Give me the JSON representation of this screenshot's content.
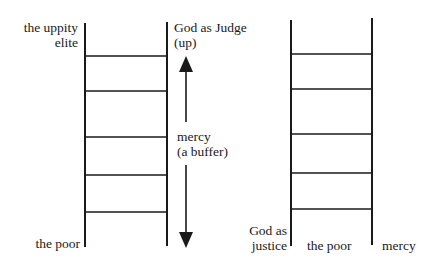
{
  "diagram": {
    "left_ladder": {
      "top_label_line1": "the uppity",
      "top_label_line2": "elite",
      "bottom_label": "the poor",
      "rungs": 5
    },
    "arrow": {
      "top_label_line1": "God as Judge",
      "top_label_line2": "(up)",
      "middle_label_line1": "mercy",
      "middle_label_line2": "(a buffer)",
      "direction": "bidirectional vertical"
    },
    "right_ladder": {
      "left_label_line1": "God as",
      "left_label_line2": "justice",
      "middle_label": "the poor",
      "right_label": "mercy",
      "rungs": 5
    },
    "colors": {
      "line": "#1a1a1a",
      "background": "#ffffff"
    }
  }
}
